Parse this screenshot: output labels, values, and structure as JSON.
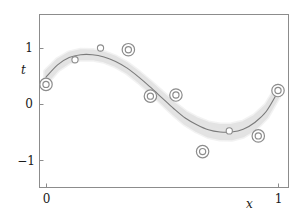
{
  "figure": {
    "name": "sinusoidal-regression-with-uncertainty-band",
    "background": "#ffffff"
  },
  "axes": {
    "x_label": "x",
    "t_label": "t",
    "x_ticks": [
      {
        "value": 0,
        "label": "0"
      },
      {
        "value": 1,
        "label": "1"
      }
    ],
    "y_ticks": [
      {
        "value": 1,
        "label": "1"
      },
      {
        "value": 0,
        "label": "0"
      },
      {
        "value": -1,
        "label": "−1"
      }
    ]
  },
  "colors": {
    "frame": "#8c8c8c",
    "curve": "#7a7a7a",
    "band": "#e3e3e3",
    "marker": "#8c8c8c",
    "text": "#1a1a1a"
  },
  "chart_data": {
    "type": "line",
    "title": "",
    "subtitle": "",
    "xlabel": "x",
    "ylabel": "t",
    "xlim": [
      -0.04,
      1.04
    ],
    "ylim": [
      -1.55,
      1.55
    ],
    "grid": false,
    "legend": null,
    "series": [
      {
        "name": "predictive mean",
        "type": "line",
        "color": "#7a7a7a",
        "x": [
          0.0,
          0.05,
          0.1,
          0.15,
          0.2,
          0.25,
          0.3,
          0.35,
          0.4,
          0.45,
          0.5,
          0.55,
          0.6,
          0.65,
          0.7,
          0.75,
          0.8,
          0.85,
          0.9,
          0.95,
          1.0
        ],
        "values": [
          0.48,
          0.7,
          0.83,
          0.88,
          0.88,
          0.84,
          0.76,
          0.64,
          0.48,
          0.3,
          0.11,
          -0.08,
          -0.25,
          -0.37,
          -0.46,
          -0.5,
          -0.5,
          -0.45,
          -0.33,
          -0.13,
          0.22
        ]
      },
      {
        "name": "predictive uncertainty band",
        "type": "band",
        "color": "#e3e3e3",
        "x": [
          0.0,
          0.05,
          0.1,
          0.15,
          0.2,
          0.25,
          0.3,
          0.35,
          0.4,
          0.45,
          0.5,
          0.55,
          0.6,
          0.65,
          0.7,
          0.75,
          0.8,
          0.85,
          0.9,
          0.95,
          1.0
        ],
        "halfwidth": [
          0.1,
          0.085,
          0.075,
          0.07,
          0.068,
          0.068,
          0.07,
          0.072,
          0.075,
          0.08,
          0.086,
          0.092,
          0.098,
          0.105,
          0.112,
          0.118,
          0.12,
          0.118,
          0.112,
          0.102,
          0.09
        ]
      },
      {
        "name": "observed data points",
        "type": "scatter",
        "color": "#8c8c8c",
        "points": [
          {
            "x": 0.0,
            "t": 0.35,
            "marker": "double-ring"
          },
          {
            "x": 0.125,
            "t": 0.79,
            "marker": "ring"
          },
          {
            "x": 0.235,
            "t": 1.0,
            "marker": "ring"
          },
          {
            "x": 0.355,
            "t": 0.97,
            "marker": "double-ring"
          },
          {
            "x": 0.45,
            "t": 0.14,
            "marker": "double-ring"
          },
          {
            "x": 0.56,
            "t": 0.16,
            "marker": "double-ring"
          },
          {
            "x": 0.675,
            "t": -0.85,
            "marker": "double-ring"
          },
          {
            "x": 0.79,
            "t": -0.48,
            "marker": "ring"
          },
          {
            "x": 0.915,
            "t": -0.57,
            "marker": "double-ring"
          },
          {
            "x": 1.0,
            "t": 0.24,
            "marker": "double-ring"
          }
        ]
      }
    ]
  }
}
